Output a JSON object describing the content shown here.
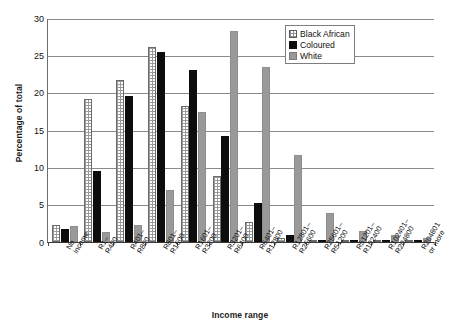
{
  "chart_data": {
    "type": "bar",
    "title": "",
    "xlabel": "Income range",
    "ylabel": "Percentage of total",
    "ylim": [
      0,
      30
    ],
    "yticks": [
      0,
      5,
      10,
      15,
      20,
      25,
      30
    ],
    "grid": true,
    "legend_position": "top-right",
    "categories": [
      "No income",
      "R1–R400",
      "R401–R800",
      "R801–R1600",
      "R1601–R3200",
      "R3201–R6400",
      "R6401–R12800",
      "R12801–R25600",
      "R25601–R51200",
      "R51201–R102400",
      "R102401–R204800",
      "R204801 or more"
    ],
    "category_lines": [
      [
        "No",
        "income"
      ],
      [
        "R1–",
        "R400"
      ],
      [
        "R401–",
        "R800"
      ],
      [
        "R801–",
        "R1600"
      ],
      [
        "R1601–",
        "R3200"
      ],
      [
        "R3201–",
        "R6400"
      ],
      [
        "R6401–",
        "R12800"
      ],
      [
        "R12801–",
        "R25600"
      ],
      [
        "R25601–",
        "R51200"
      ],
      [
        "R51201–",
        "R102400"
      ],
      [
        "R102401–",
        "R204800"
      ],
      [
        "R204801",
        "or more"
      ]
    ],
    "series": [
      {
        "name": "Black African",
        "color": "#ffffff",
        "pattern": "checkered",
        "values": [
          2.3,
          19.1,
          21.7,
          26.1,
          18.2,
          8.9,
          2.7,
          0.6,
          0.1,
          0.05,
          0.0,
          0.0
        ]
      },
      {
        "name": "Coloured",
        "color": "#0d0d0d",
        "pattern": "solid",
        "values": [
          1.8,
          9.5,
          19.6,
          25.4,
          23.0,
          14.2,
          5.2,
          1.0,
          0.3,
          0.1,
          0.05,
          0.0
        ]
      },
      {
        "name": "White",
        "color": "#999999",
        "pattern": "solid",
        "values": [
          2.2,
          1.4,
          2.3,
          7.0,
          17.4,
          28.3,
          23.5,
          11.6,
          3.9,
          1.5,
          0.9,
          0.5
        ]
      }
    ]
  },
  "legend": {
    "items": [
      {
        "label": "Black African"
      },
      {
        "label": "Coloured"
      },
      {
        "label": "White"
      }
    ]
  }
}
